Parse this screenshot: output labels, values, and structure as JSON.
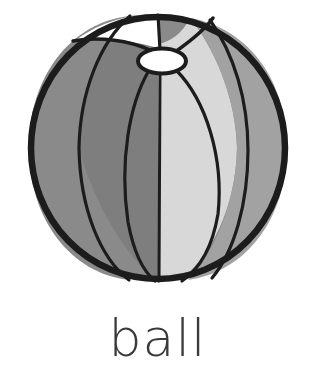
{
  "card": {
    "kind": "picture-word-flashcard",
    "background_color": "#ffffff",
    "word": "ball",
    "word_color": "#3a3a3a"
  },
  "illustration": {
    "name": "beach-ball",
    "outline_color": "#1c1c1c",
    "outline_width": 6,
    "seam_color": "#1c1c1c",
    "seam_width": 3,
    "circle": {
      "center_x": 158,
      "center_y": 148,
      "radius_x": 129,
      "radius_y": 133
    },
    "valve": {
      "name": "valve-cap",
      "center_x": 162,
      "center_y": 61,
      "radius_x": 23,
      "radius_y": 12,
      "fill": "#ffffff"
    },
    "panels": [
      {
        "name": "panel-far-left",
        "fill": "#8a8a8a"
      },
      {
        "name": "panel-left",
        "fill": "#7e7e7e"
      },
      {
        "name": "panel-center-left",
        "fill": "#818181"
      },
      {
        "name": "panel-center-right",
        "fill": "#d8d8d8"
      },
      {
        "name": "panel-right",
        "fill": "#a2a2a2"
      },
      {
        "name": "panel-top-wedge",
        "fill": "#ffffff"
      }
    ]
  }
}
